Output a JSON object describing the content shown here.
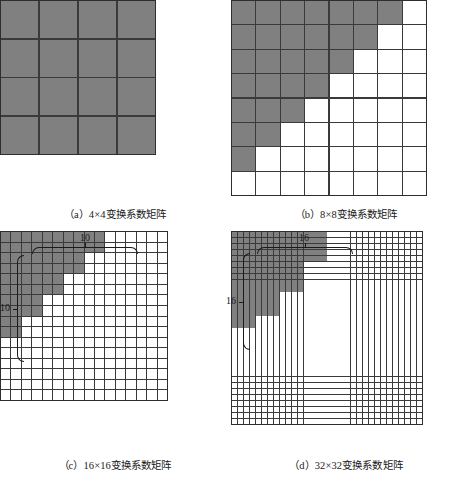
{
  "figure": {
    "background": "#ffffff",
    "fill_color": "#808080",
    "empty_color": "#ffffff",
    "grid_line_color": "#3a3a3a"
  },
  "chart_data": {
    "type": "heatmap",
    "title": "",
    "panels": [
      {
        "id": "a",
        "caption": "（a）4×4变换系数矩阵",
        "size": 4,
        "cols": 4,
        "rows": 4,
        "filled_per_row": [
          4,
          4,
          4,
          4
        ],
        "brace_top_label": "",
        "brace_left_label": ""
      },
      {
        "id": "b",
        "caption": "（b）8×8变换系数矩阵",
        "size": 8,
        "cols": 8,
        "rows": 8,
        "filled_per_row": [
          7,
          6,
          5,
          4,
          3,
          2,
          1,
          0
        ],
        "brace_top_label": "",
        "brace_left_label": ""
      },
      {
        "id": "c",
        "caption": "（c）16×16变换系数矩阵",
        "size": 16,
        "cols": 16,
        "rows": 16,
        "filled_per_row": [
          10,
          10,
          8,
          8,
          6,
          6,
          4,
          4,
          2,
          2,
          0,
          0,
          0,
          0,
          0,
          0
        ],
        "brace_top_label": "10",
        "brace_left_label": "10"
      },
      {
        "id": "d",
        "caption": "（d）32×32变换系数矩阵",
        "size": 32,
        "cols": 32,
        "rows": 32,
        "filled_per_row": [
          16,
          16,
          16,
          16,
          16,
          12,
          12,
          12,
          12,
          12,
          8,
          8,
          8,
          8,
          4,
          4,
          0,
          0,
          0,
          0,
          0,
          0,
          0,
          0,
          0,
          0,
          0,
          0,
          0,
          0,
          0,
          0
        ],
        "brace_top_label": "16",
        "brace_left_label": "16"
      }
    ]
  }
}
